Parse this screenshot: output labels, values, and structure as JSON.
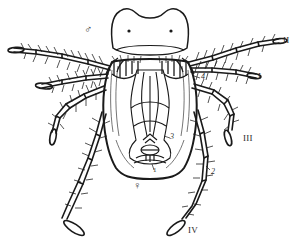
{
  "figure": {
    "kind": "scientific-line-drawing",
    "background_color": "#ffffff",
    "ink_color": "#1a1a1a"
  },
  "labels": {
    "leg_1": "I",
    "leg_2": "II",
    "leg_3": "III",
    "leg_4": "IV",
    "seta_1": "1",
    "seta_2": "2",
    "seta_3": "3",
    "seta_4": "4",
    "male_symbol": "♂",
    "female_symbol": "♀"
  }
}
